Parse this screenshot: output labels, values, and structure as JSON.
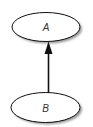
{
  "diagram": {
    "type": "directed-graph",
    "colors": {
      "background": "#ffffff",
      "node_fill": "#ffffff",
      "node_stroke": "#111111",
      "node_shadow": "#9a9a9a",
      "edge": "#111111",
      "label": "#333333"
    },
    "nodes": [
      {
        "id": "A",
        "label": "A",
        "cx": 46,
        "cy": 27,
        "rx": 34,
        "ry": 14.5
      },
      {
        "id": "B",
        "label": "B",
        "cx": 45.5,
        "cy": 107.5,
        "rx": 34.5,
        "ry": 15
      }
    ],
    "edges": [
      {
        "from": "B",
        "to": "A",
        "arrow": "head-at-target"
      }
    ]
  }
}
